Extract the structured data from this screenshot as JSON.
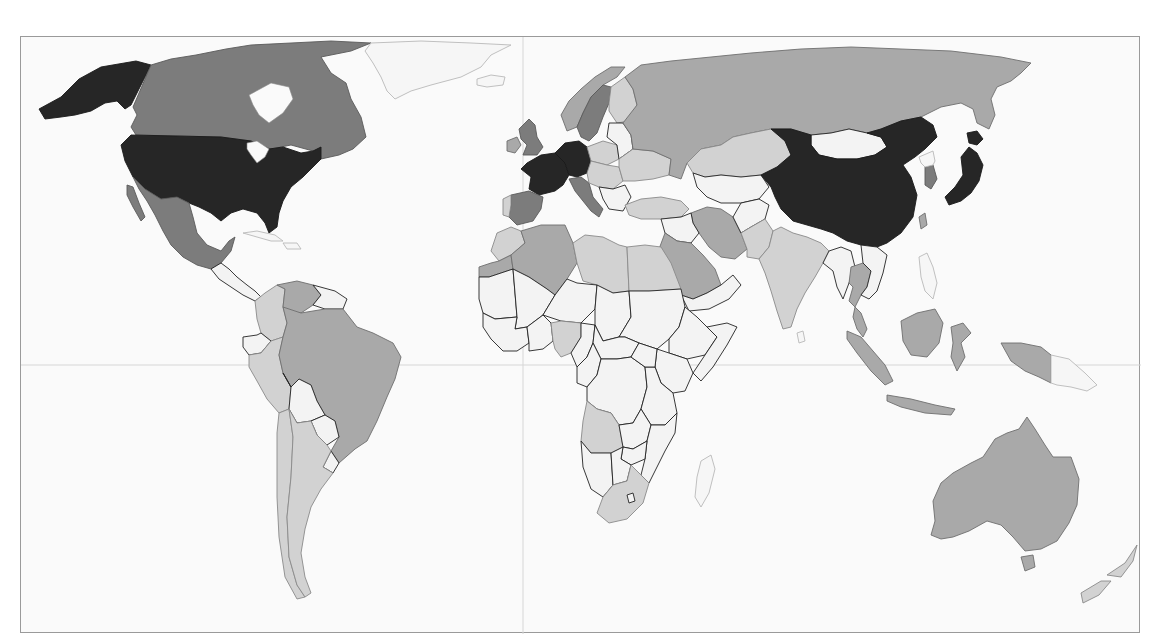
{
  "map": {
    "type": "choropleth-world-map",
    "color_scheme": "grayscale",
    "frame": {
      "background": "#fafafa",
      "border": "#9a9a9a"
    },
    "classes": [
      {
        "level": 5,
        "color": "#262626",
        "description": "darkest"
      },
      {
        "level": 4,
        "color": "#7c7c7c",
        "description": "dark gray"
      },
      {
        "level": 3,
        "color": "#a9a9a9",
        "description": "medium gray"
      },
      {
        "level": 2,
        "color": "#d2d2d2",
        "description": "light gray"
      },
      {
        "level": 1,
        "color": "#f3f3f3",
        "description": "near white"
      }
    ],
    "regions": {
      "level_5": [
        "United States",
        "France",
        "Germany",
        "China",
        "Japan"
      ],
      "level_4": [
        "Canada",
        "Mexico",
        "United Kingdom",
        "Italy",
        "Spain",
        "Sweden",
        "Netherlands",
        "South Korea"
      ],
      "level_3": [
        "Russia",
        "Brazil",
        "Australia",
        "Saudi Arabia",
        "Indonesia",
        "Thailand",
        "Malaysia",
        "Venezuela",
        "Algeria",
        "Norway",
        "Ireland",
        "Western Sahara",
        "Iran"
      ],
      "level_2": [
        "India",
        "Argentina",
        "Chile",
        "Nigeria",
        "South Africa",
        "Turkey",
        "Kazakhstan",
        "Poland",
        "Ukraine",
        "Colombia",
        "Peru",
        "Egypt",
        "Libya",
        "Angola",
        "Finland",
        "Greenland",
        "Pakistan",
        "New Zealand"
      ],
      "level_1": [
        "other countries"
      ]
    },
    "gridlines": {
      "equator": true,
      "prime_meridian": true
    }
  }
}
